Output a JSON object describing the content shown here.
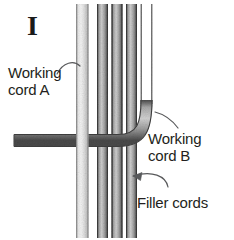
{
  "figure": {
    "step_numeral": "I",
    "background_color": "#ffffff",
    "ink_color": "#231f20"
  },
  "labels": {
    "cord_a": {
      "line1": "Working",
      "line2": "cord A",
      "icon": "leader-line-curve-up-right"
    },
    "cord_b": {
      "line1": "Working",
      "line2": "cord B",
      "icon": "leader-line-curve-up-left"
    },
    "filler": {
      "line1": "Filler cords",
      "icon": "leader-line-curve-left-arrow"
    }
  },
  "cords": {
    "working_cord_a": {
      "name": "working cord A",
      "shade": "#d9d9d9",
      "edge": "#9a9a9a",
      "orientation": "vertical-light"
    },
    "filler_cords": {
      "name": "filler cords",
      "count": 3,
      "shade": "#b0b0b0",
      "edge": "#5a5a5a",
      "orientation": "vertical-dark"
    },
    "working_cord_b": {
      "name": "working cord B",
      "shade": "#b8b8b8",
      "edge": "#555555",
      "orientation": "vertical-then-bends-left-horizontal"
    }
  }
}
